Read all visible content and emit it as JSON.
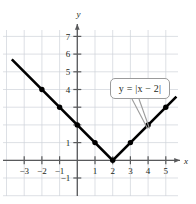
{
  "figure": {
    "name": "absolute-value-function-graph",
    "axis_labels": {
      "x": "x",
      "y": "y"
    },
    "callout": {
      "text": "y = |x − 2|",
      "lhs": "y",
      "equals": "=",
      "rhs": "|x − 2|"
    }
  },
  "chart_data": {
    "type": "line",
    "title": "",
    "xlabel": "x",
    "ylabel": "y",
    "xlim": [
      -3.9,
      5.8
    ],
    "ylim": [
      -1.55,
      7.9
    ],
    "grid": true,
    "legend": "none",
    "annotations": [
      {
        "text": "y = |x − 2|",
        "type": "callout-box",
        "points_to": [
          4,
          2
        ]
      }
    ],
    "xticks": [
      -3,
      -2,
      -1,
      1,
      2,
      3,
      4,
      5
    ],
    "xtick_labels": [
      "−3",
      "−2",
      "−1",
      "1",
      "2",
      "3",
      "4",
      "5"
    ],
    "yticks": [
      -1,
      1,
      4,
      5,
      6,
      7
    ],
    "ytick_labels": [
      "−1",
      "1",
      "4",
      "5",
      "6",
      "7"
    ],
    "series": [
      {
        "name": "y = |x - 2|",
        "equation": "y = |x - 2|",
        "color": "#000000",
        "x": [
          -3.7,
          2,
          5.6
        ],
        "y": [
          5.7,
          0,
          3.6
        ],
        "vertex": [
          2,
          0
        ],
        "marked_points": [
          [
            -2,
            4
          ],
          [
            -1,
            3
          ],
          [
            0,
            2
          ],
          [
            1,
            1
          ],
          [
            2,
            0
          ],
          [
            3,
            1
          ],
          [
            4,
            2
          ],
          [
            5,
            3
          ]
        ]
      }
    ]
  }
}
